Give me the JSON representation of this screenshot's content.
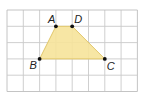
{
  "figure": {
    "type": "trapezoid-on-grid",
    "grid": {
      "columns": 8,
      "rows": 5,
      "origin_px": [
        7,
        10
      ],
      "cell_px": 16.3,
      "line_color": "#c9c9c9",
      "border_color": "#bdbdbd"
    },
    "shape": {
      "fill": "#f6e39a",
      "stroke": "#e2c76a"
    },
    "points": [
      {
        "label": "A",
        "grid": [
          3,
          1
        ]
      },
      {
        "label": "D",
        "grid": [
          4,
          1
        ]
      },
      {
        "label": "C",
        "grid": [
          6,
          3
        ]
      },
      {
        "label": "B",
        "grid": [
          2,
          3
        ]
      }
    ],
    "labels": {
      "A": "A",
      "B": "B",
      "C": "C",
      "D": "D"
    }
  }
}
